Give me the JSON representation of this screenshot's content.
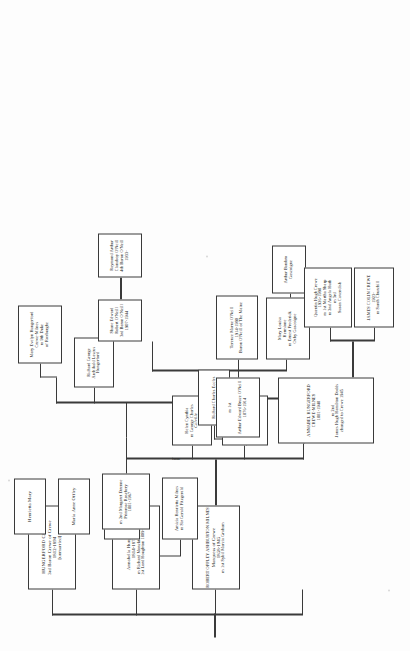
{
  "document": {
    "type": "genealogical-chart",
    "family": "Crewe / Crewe-Milnes / O'Neill",
    "orientation": "rotated-90-ccw",
    "page_width": 410,
    "page_height": 651,
    "ink_color": "#3a3a3a",
    "paper_color": "#fdfdfd"
  },
  "connector_labels": [
    {
      "id": "issue-1",
      "text": "issue"
    },
    {
      "id": "issue-2",
      "text": "issue"
    }
  ],
  "nodes": [
    {
      "id": "hungerford-crewe",
      "lines": [
        "HUNGERFORD CREWE",
        "3rd Baron Crewe of Crewe",
        "1812-1894",
        "[unmarried]"
      ]
    },
    {
      "id": "annabella-hungerford",
      "lines": [
        "Annabella Hungerford",
        "1814-1874",
        "m Richard Monckton Milnes",
        "1st Lord Houghton 1809-1885"
      ]
    },
    {
      "id": "maria-anne-offley",
      "lines": [
        "Maria Anne Offley"
      ]
    },
    {
      "id": "henrietta-mary",
      "lines": [
        "Henrietta Mary"
      ]
    },
    {
      "id": "robert-offley-ashburton-milnes",
      "lines": [
        "ROBERT OFFLEY ASHBURTON MILNES",
        "Marquess of Crewe",
        "1858-1945",
        "m 1st Sybil Marcia Graham"
      ]
    },
    {
      "id": "florence-milnes",
      "lines": [
        "Florence Milnes",
        "m Arthur",
        "Henniker-Major"
      ]
    },
    {
      "id": "amicia-henrietta-milnes",
      "lines": [
        "Amicia Henrietta Milnes",
        "m Sir Gerald Fitzgerald"
      ]
    },
    {
      "id": "margaret-primrose",
      "lines": [
        "m 2nd Margaret Etrenne",
        "Primrose Rosebery",
        "1881-1967"
      ]
    },
    {
      "id": "annabel-hungerford-crewe-milnes",
      "lines": [
        "ANNABEL HUNGERFORD",
        "CREWE-MILNES",
        "1881-1948",
        "m 2nd",
        "James Hugh Hamilton Dodds",
        "changed to Crewe 1945"
      ]
    },
    {
      "id": "helen-cynthia",
      "lines": [
        "Helen Cynthia",
        "m George Charles",
        "Colville"
      ]
    },
    {
      "id": "celia-hermione",
      "lines": [
        "Cecilia Hermione",
        "m Sir Edward",
        "Clive Coates",
        "Coates-Milnes",
        "from 1946"
      ]
    },
    {
      "id": "richard-charles-eccles",
      "lines": [
        "Richard Charles Eccles"
      ]
    },
    {
      "id": "arthur-edward-bruce-oneill",
      "lines": [
        "m 1st",
        "Arthur Edward Bruce O'Neill",
        "1876-1914"
      ]
    },
    {
      "id": "richard-george-hungerford",
      "lines": [
        "Richard George",
        "Archibald Lascus",
        "Hungerford"
      ]
    },
    {
      "id": "mary-evelyn-hungerford",
      "lines": [
        "Mary Evelyn Hungerford",
        "Crewe-Milnes",
        "m 9th Duke",
        "of Roxburghe"
      ]
    },
    {
      "id": "terence-marne-oneill",
      "lines": [
        "Terence Marne O'Neill",
        "1914-1990",
        "Baron O'Neill of The Maine"
      ]
    },
    {
      "id": "mary-louisa-hermione",
      "lines": [
        "Mary Louisa",
        "Hermione",
        "m Ernest Frederick",
        "Oxby Gascoigne"
      ]
    },
    {
      "id": "arthur-bambro-gascoigne",
      "lines": [
        "Arthur Bambro",
        "Gascoigne"
      ]
    },
    {
      "id": "shane-edward-robert-oneill",
      "lines": [
        "Shane Edward",
        "Robert O'Neill",
        "3rd Baron O'Neill",
        "1907-1944"
      ]
    },
    {
      "id": "raymond-arthur-clanaboy-oneill",
      "lines": [
        "Raymond Arthur",
        "Clanaboy O'Neill",
        "4th Baron O'Neill",
        "1933-"
      ]
    },
    {
      "id": "james-colin-crewe",
      "lines": [
        "JAMES COLIN CREWE",
        "1923-",
        "m Sarah Churchill"
      ]
    },
    {
      "id": "quentin-hugh-crewe",
      "lines": [
        "Quentin Hugh Crewe",
        "1926-1998",
        "m 1st Martha Sharp",
        "m 2nd Angela Huth",
        "m 3rd",
        "Susan Cavendish"
      ]
    }
  ]
}
